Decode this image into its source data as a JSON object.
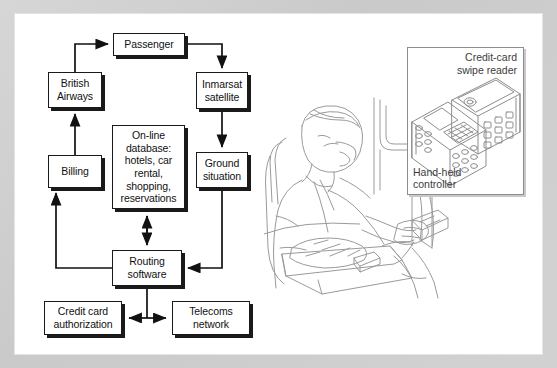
{
  "figure": {
    "frame_color": "#d2d2d2",
    "box_border_color": "#1a1a1a",
    "line_art_color": "#8d8d8d"
  },
  "flowchart": {
    "nodes": [
      {
        "id": "passenger",
        "label": "Passenger"
      },
      {
        "id": "british-airways",
        "label": "British\nAirways"
      },
      {
        "id": "inmarsat",
        "label": "Inmarsat\nsatellite"
      },
      {
        "id": "billing",
        "label": "Billing"
      },
      {
        "id": "online-database",
        "label": "On-line\ndatabase:\nhotels, car\nrental,\nshopping,\nreservations"
      },
      {
        "id": "ground-situation",
        "label": "Ground\nsituation"
      },
      {
        "id": "routing-software",
        "label": "Routing\nsoftware"
      },
      {
        "id": "credit-card-authorization",
        "label": "Credit card\nauthorization"
      },
      {
        "id": "telecoms-network",
        "label": "Telecoms\nnetwork"
      }
    ],
    "edges": [
      {
        "from": "british-airways",
        "to": "passenger",
        "style": "single"
      },
      {
        "from": "passenger",
        "to": "inmarsat",
        "style": "single"
      },
      {
        "from": "inmarsat",
        "to": "ground-situation",
        "style": "single"
      },
      {
        "from": "billing",
        "to": "british-airways",
        "style": "single"
      },
      {
        "from": "routing-software",
        "to": "billing",
        "style": "single"
      },
      {
        "from": "routing-software",
        "to": "online-database",
        "style": "double"
      },
      {
        "from": "ground-situation",
        "to": "routing-software",
        "style": "single"
      },
      {
        "from": "credit-card-authorization",
        "to": "telecoms-network",
        "style": "double"
      },
      {
        "from": "routing-software",
        "to": "credit-card-telecoms-junction",
        "style": "plain"
      }
    ]
  },
  "inset": {
    "labels": {
      "swipe_reader": "Credit-card\nswipe reader",
      "handheld_controller": "Hand-held\ncontroller"
    },
    "devices": [
      {
        "id": "handheld-controller-device",
        "name": "hand-held controller"
      },
      {
        "id": "swipe-reader-device",
        "name": "credit-card swipe reader"
      }
    ]
  },
  "illustration": {
    "name": "seated airline passenger using hand-held controller at tray table"
  }
}
